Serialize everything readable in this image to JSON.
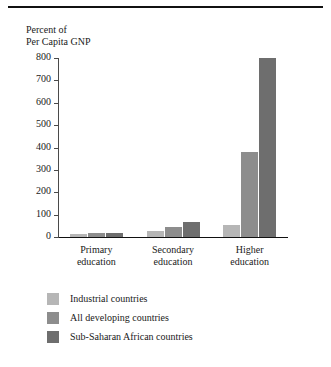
{
  "chart_data": {
    "type": "bar",
    "title": "Percent of Per Capita GNP",
    "title_lines": [
      "Percent of",
      "Per Capita GNP"
    ],
    "xlabel": "",
    "ylabel": "Percent of Per Capita GNP",
    "ylim": [
      0,
      800
    ],
    "ytick_step": 100,
    "yticks": [
      800,
      700,
      600,
      500,
      400,
      300,
      200,
      100,
      0
    ],
    "ytick_labels": [
      "800",
      "700",
      "600",
      "500",
      "400",
      "300",
      "200",
      "100",
      "0"
    ],
    "grid": false,
    "legend_position": "below-left",
    "categories": [
      "Primary education",
      "Secondary education",
      "Higher education"
    ],
    "category_lines": [
      [
        "Primary",
        "education"
      ],
      [
        "Secondary",
        "education"
      ],
      [
        "Higher",
        "education"
      ]
    ],
    "series": [
      {
        "name": "Industrial countries",
        "color": "#b6b6b6",
        "values": [
          12,
          25,
          55
        ]
      },
      {
        "name": "All developing countries",
        "color": "#8d8d8d",
        "values": [
          18,
          45,
          380
        ]
      },
      {
        "name": "Sub-Saharan African countries",
        "color": "#6e6e6e",
        "values": [
          20,
          65,
          800
        ]
      }
    ]
  },
  "legend": {
    "entries": [
      {
        "label": "Industrial countries",
        "color": "#b6b6b6"
      },
      {
        "label": "All developing countries",
        "color": "#8d8d8d"
      },
      {
        "label": "Sub-Saharan African countries",
        "color": "#6e6e6e"
      }
    ]
  },
  "style": {
    "background": "#ffffff",
    "axis_color": "#4a4a4a",
    "rule_color": "#111111",
    "text_color": "#1a1a1a"
  }
}
